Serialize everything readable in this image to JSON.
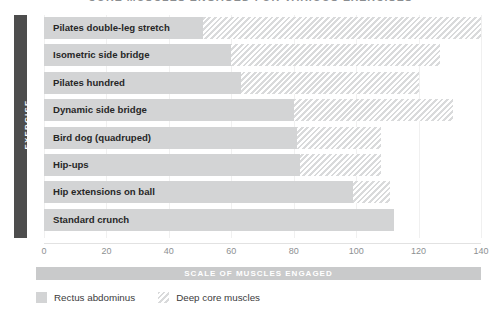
{
  "chart_data": {
    "type": "bar",
    "orientation": "horizontal",
    "stacked": true,
    "title": "CORE MUSCLES ENGAGED FOR VARIOUS EXERCISES",
    "xlabel": "SCALE OF MUSCLES ENGAGED",
    "ylabel": "EXERCISE",
    "xlim": [
      0,
      140
    ],
    "ticks": [
      0,
      20,
      40,
      60,
      80,
      100,
      120,
      140
    ],
    "tick_labels": [
      "0",
      "20",
      "40",
      "60",
      "80",
      "100",
      "120",
      "140"
    ],
    "grid": true,
    "legend_position": "bottom-left",
    "categories": [
      "Pilates double-leg stretch",
      "Isometric side bridge",
      "Pilates hundred",
      "Dynamic side bridge",
      "Bird dog (quadruped)",
      "Hip-ups",
      "Hip extensions on ball",
      "Standard crunch"
    ],
    "series": [
      {
        "name": "Rectus abdominus",
        "color": "#d3d4d5",
        "fill": "solid",
        "values": [
          51,
          60,
          63,
          80,
          81,
          82,
          99,
          112
        ]
      },
      {
        "name": "Deep core muscles",
        "color": "#e8e9ea",
        "fill": "hatched",
        "values": [
          89,
          67,
          57,
          51,
          27,
          26,
          12,
          0
        ]
      }
    ],
    "totals": [
      140,
      127,
      120,
      131,
      108,
      108,
      111,
      112
    ]
  },
  "legend": {
    "items": [
      {
        "label": "Rectus abdominus",
        "swatch": "solid-swatch"
      },
      {
        "label": "Deep core muscles",
        "swatch": "hatched-swatch"
      }
    ]
  }
}
